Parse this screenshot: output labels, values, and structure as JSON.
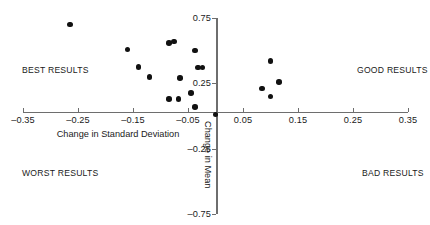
{
  "chart_data": {
    "type": "scatter",
    "title": "",
    "xlabel": "Change in Standard Deviation",
    "ylabel": "Change in Mean",
    "xlim": [
      -0.35,
      0.35
    ],
    "ylim": [
      -0.75,
      0.75
    ],
    "grid": false,
    "legend": null,
    "xticks": [
      "–0.35",
      "–0.25",
      "–0.15",
      "–0.05",
      "0.05",
      "0.15",
      "0.25",
      "0.35"
    ],
    "xtick_values": [
      -0.35,
      -0.25,
      -0.15,
      -0.05,
      0.05,
      0.15,
      0.25,
      0.35
    ],
    "yticks": [
      "0.75",
      "0.25",
      "–0.25",
      "–0.75"
    ],
    "ytick_values": [
      0.75,
      0.25,
      -0.25,
      -0.75
    ],
    "point_color": "#111111",
    "axis_color": "#6e6e6e",
    "annotations": [
      {
        "text": "BEST RESULTS",
        "quadrant": "upper-left"
      },
      {
        "text": "GOOD RESULTS",
        "quadrant": "upper-right"
      },
      {
        "text": "WORST RESULTS",
        "quadrant": "lower-left"
      },
      {
        "text": "BAD RESULTS",
        "quadrant": "lower-right"
      }
    ],
    "points": [
      {
        "x": -0.265,
        "y": 0.7
      },
      {
        "x": -0.16,
        "y": 0.51
      },
      {
        "x": -0.085,
        "y": 0.56
      },
      {
        "x": -0.075,
        "y": 0.57
      },
      {
        "x": -0.037,
        "y": 0.5
      },
      {
        "x": -0.14,
        "y": 0.375
      },
      {
        "x": -0.12,
        "y": 0.3
      },
      {
        "x": -0.065,
        "y": 0.29
      },
      {
        "x": -0.032,
        "y": 0.37
      },
      {
        "x": -0.024,
        "y": 0.37
      },
      {
        "x": -0.045,
        "y": 0.175
      },
      {
        "x": -0.085,
        "y": 0.13
      },
      {
        "x": -0.067,
        "y": 0.13
      },
      {
        "x": -0.037,
        "y": 0.07
      },
      {
        "x": 0.0,
        "y": 0.01
      },
      {
        "x": 0.1,
        "y": 0.42
      },
      {
        "x": 0.085,
        "y": 0.21
      },
      {
        "x": 0.115,
        "y": 0.26
      },
      {
        "x": 0.1,
        "y": 0.15
      }
    ]
  }
}
